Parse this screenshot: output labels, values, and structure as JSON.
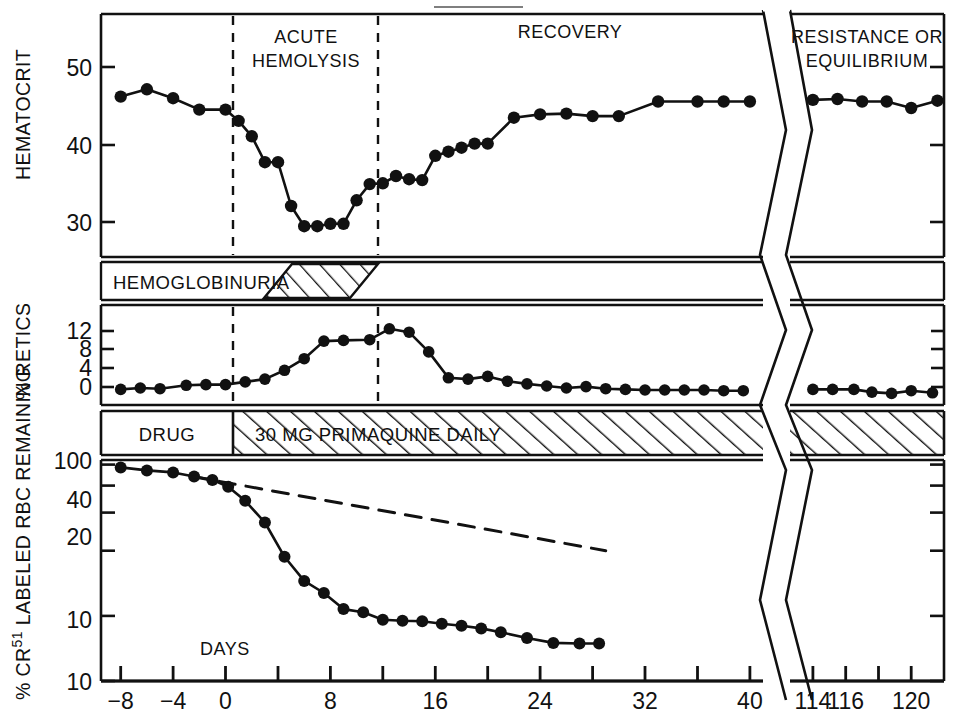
{
  "figure": {
    "title": "",
    "x_axis_label": "DAYS",
    "axis_break_note": "zigzag break between day 40 and day 114"
  },
  "phases": [
    {
      "name": "acute-hemolysis",
      "label_line1": "ACUTE",
      "label_line2": "HEMOLYSIS",
      "start_day": 0,
      "end_day": 11
    },
    {
      "name": "recovery",
      "label_line1": "RECOVERY",
      "label_line2": "",
      "start_day": 11,
      "end_day": 40
    },
    {
      "name": "resistance-or-equilibrium",
      "label_line1": "RESISTANCE OR",
      "label_line2": "EQUILIBRIUM",
      "start_day": 113,
      "end_day": 122
    }
  ],
  "bands": [
    {
      "name": "hemoglobinuria",
      "label": "HEMOGLOBINURIA",
      "hatch_start_day": 2.4,
      "hatch_end_day": 11
    },
    {
      "name": "drug",
      "label": "DRUG",
      "dose_label": "30 MG PRIMAQUINE DAILY",
      "hatch_start_day": 0,
      "hatch_end_day": 122
    }
  ],
  "axis": {
    "x_ticks": [
      -8,
      -4,
      0,
      4,
      8,
      12,
      16,
      20,
      24,
      28,
      32,
      36,
      40
    ],
    "x_tick_labels": [
      "−8",
      "−4",
      "0",
      "",
      "8",
      "",
      "16",
      "",
      "24",
      "",
      "32",
      "",
      "40"
    ],
    "x_ticks_right": [
      114,
      116,
      118,
      120
    ],
    "x_tick_labels_right": [
      "114",
      "116",
      "",
      "120"
    ],
    "x_min": -9.5,
    "x_max": 41,
    "x_min_right": 112.6,
    "x_max_right": 122
  },
  "chart_data": [
    {
      "type": "line",
      "name": "hematocrit",
      "title": "",
      "xlabel": "DAYS",
      "ylabel": "HEMATOCRIT",
      "ylim": [
        26,
        56
      ],
      "yticks": [
        30,
        40,
        50
      ],
      "ytick_labels": [
        "30",
        "40",
        "50"
      ],
      "grid": false,
      "legend": "none",
      "x": [
        -8,
        -6,
        -4,
        -2,
        0,
        1,
        2,
        3,
        4,
        5,
        6,
        7,
        8,
        9,
        10,
        11,
        12,
        13,
        14,
        15,
        16,
        17,
        18,
        19,
        20,
        22,
        24,
        26,
        28,
        30,
        33,
        36,
        38,
        40
      ],
      "values": [
        45.8,
        46.7,
        45.6,
        44.2,
        44.2,
        42.8,
        40.9,
        37.7,
        37.7,
        32.3,
        29.8,
        29.8,
        30.1,
        30.1,
        33.0,
        35.0,
        35.1,
        36.0,
        35.6,
        35.5,
        38.5,
        39.0,
        39.5,
        40.0,
        40.0,
        43.2,
        43.6,
        43.7,
        43.4,
        43.4,
        45.2,
        45.2,
        45.2,
        45.2
      ],
      "x_right": [
        114,
        115.5,
        117,
        118.5,
        120,
        121.6
      ],
      "values_right": [
        45.4,
        45.5,
        45.2,
        45.2,
        44.4,
        45.3
      ]
    },
    {
      "type": "line",
      "name": "percent-retics",
      "title": "",
      "xlabel": "DAYS",
      "ylabel": "% RETICS",
      "ylim": [
        -1.2,
        13.5
      ],
      "yticks": [
        0,
        4,
        8,
        12
      ],
      "ytick_labels": [
        "0",
        "4",
        "8",
        "12"
      ],
      "grid": false,
      "legend": "none",
      "x": [
        -8,
        -6.5,
        -5,
        -3,
        -1.5,
        0,
        1.5,
        3,
        4.5,
        6,
        7.5,
        9,
        11,
        12.5,
        14,
        15.5,
        17,
        18.5,
        20,
        21.5,
        23,
        24.5,
        26,
        27.5,
        29,
        30.5,
        32,
        33.5,
        35,
        36.5,
        38,
        39.5
      ],
      "values": [
        1.1,
        1.3,
        1.2,
        1.7,
        1.8,
        1.8,
        2.2,
        2.6,
        3.9,
        5.6,
        8.2,
        8.3,
        8.4,
        10.0,
        9.5,
        6.6,
        2.8,
        2.6,
        3.0,
        2.3,
        1.9,
        1.6,
        1.3,
        1.5,
        1.2,
        1.1,
        1.0,
        1.0,
        1.0,
        1.0,
        0.9,
        0.9
      ],
      "x_right": [
        114,
        115.2,
        116.5,
        117.6,
        118.8,
        120,
        121.3
      ],
      "values_right": [
        1.1,
        1.1,
        1.1,
        0.7,
        0.5,
        0.9,
        0.6
      ]
    },
    {
      "type": "line",
      "name": "percent-cr51-labeled-rbc-remaining",
      "title": "",
      "xlabel": "DAYS",
      "ylabel": "% CR51 LABELED RBC REMAINING",
      "ylabel_parts": {
        "prefix": "% CR",
        "superscript": "51",
        "suffix": " LABELED RBC REMAINING"
      },
      "yscale": "log",
      "ylim": [
        10,
        105
      ],
      "yticks": [
        10,
        20,
        40,
        60,
        80,
        100
      ],
      "ytick_labels": [
        "10",
        "20",
        "40",
        "60",
        "",
        "100"
      ],
      "grid": false,
      "legend": "none",
      "series": [
        {
          "name": "observed",
          "style": "solid-with-markers",
          "x": [
            -8,
            -6,
            -4,
            -2.4,
            -1,
            0.2,
            1.5,
            3,
            4.5,
            6,
            7.5,
            9,
            10.5,
            12,
            13.5,
            15,
            16.5,
            18,
            19.5,
            21,
            23,
            25,
            27,
            28.5
          ],
          "values": [
            97,
            94,
            92,
            88,
            85,
            79,
            68,
            54,
            37.5,
            29,
            25.5,
            21.5,
            20.8,
            19.2,
            19.0,
            18.9,
            18.4,
            18.0,
            17.5,
            16.8,
            15.8,
            15.0,
            14.9,
            14.9
          ]
        },
        {
          "name": "expected-senescence",
          "style": "dashed",
          "x": [
            -2.5,
            29
          ],
          "values": [
            88,
            40
          ]
        }
      ]
    }
  ]
}
